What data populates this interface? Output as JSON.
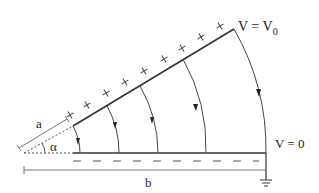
{
  "figure": {
    "labels": {
      "upper_plate_potential": "V = V",
      "upper_plate_potential_sub": "0",
      "lower_plate_potential": "V = 0",
      "dimension_a": "a",
      "dimension_b": "b",
      "angle": "α"
    },
    "upper_plate": {
      "charge_sign": "+",
      "charge_count": 12
    },
    "lower_plate": {
      "charge_sign": "−",
      "charge_count": 8
    },
    "field_lines": {
      "count": 5,
      "direction": "from upper plate to lower plate"
    },
    "colors": {
      "line": "#333333",
      "dimension": "#777777",
      "background": "#ffffff"
    }
  }
}
